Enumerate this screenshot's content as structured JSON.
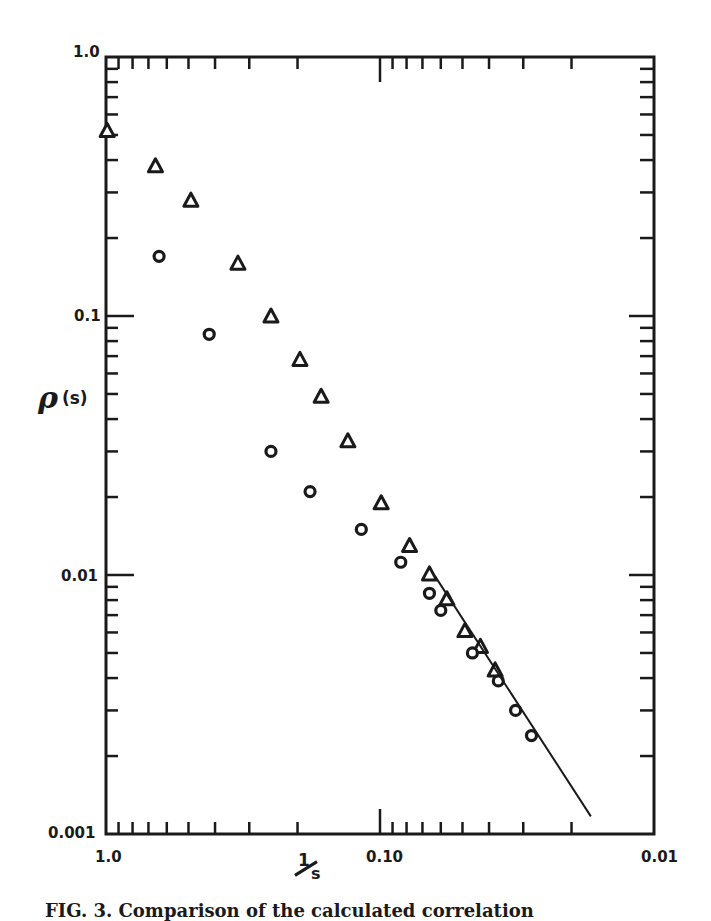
{
  "figure": {
    "caption": "FIG. 3.   Comparison of the calculated correlation"
  },
  "axes": {
    "ylabel_symbol": "ρ",
    "ylabel_arg": "(s)",
    "xlabel_numerator": "1",
    "xlabel_denominator": "s",
    "y_ticks": [
      {
        "value": 1.0,
        "label": "1.0"
      },
      {
        "value": 0.1,
        "label": "0.1"
      },
      {
        "value": 0.01,
        "label": "0.01"
      },
      {
        "value": 0.001,
        "label": "0.001"
      }
    ],
    "x_ticks": [
      {
        "value": 1.0,
        "label": "1.0"
      },
      {
        "value": 0.1,
        "label": "0.10"
      },
      {
        "value": 0.01,
        "label": "0.01"
      }
    ]
  },
  "chart_data": {
    "type": "scatter",
    "title": "",
    "xlabel": "1/s",
    "ylabel": "ρ(s)",
    "xscale": "log",
    "yscale": "log",
    "x_reversed": true,
    "xlim": [
      1.0,
      0.01
    ],
    "ylim": [
      0.001,
      1.0
    ],
    "grid": false,
    "legend": null,
    "x_tick_labels": [
      "1.0",
      "0.10",
      "0.01"
    ],
    "y_tick_labels": [
      "1.0",
      "0.1",
      "0.01",
      "0.001"
    ],
    "series": [
      {
        "name": "triangles",
        "marker": "triangle",
        "points": [
          {
            "x": 0.99,
            "y": 0.52
          },
          {
            "x": 0.66,
            "y": 0.38
          },
          {
            "x": 0.49,
            "y": 0.28
          },
          {
            "x": 0.33,
            "y": 0.16
          },
          {
            "x": 0.25,
            "y": 0.1
          },
          {
            "x": 0.196,
            "y": 0.068
          },
          {
            "x": 0.164,
            "y": 0.049
          },
          {
            "x": 0.131,
            "y": 0.033
          },
          {
            "x": 0.099,
            "y": 0.019
          },
          {
            "x": 0.078,
            "y": 0.013
          },
          {
            "x": 0.066,
            "y": 0.0101
          },
          {
            "x": 0.057,
            "y": 0.0081
          },
          {
            "x": 0.049,
            "y": 0.0061
          },
          {
            "x": 0.043,
            "y": 0.0053
          },
          {
            "x": 0.038,
            "y": 0.0043
          }
        ]
      },
      {
        "name": "circles",
        "marker": "circle",
        "points": [
          {
            "x": 0.64,
            "y": 0.17
          },
          {
            "x": 0.42,
            "y": 0.085
          },
          {
            "x": 0.25,
            "y": 0.03
          },
          {
            "x": 0.18,
            "y": 0.021
          },
          {
            "x": 0.117,
            "y": 0.015
          },
          {
            "x": 0.084,
            "y": 0.0112
          },
          {
            "x": 0.066,
            "y": 0.0085
          },
          {
            "x": 0.06,
            "y": 0.0073
          },
          {
            "x": 0.046,
            "y": 0.005
          },
          {
            "x": 0.037,
            "y": 0.0039
          },
          {
            "x": 0.032,
            "y": 0.003
          },
          {
            "x": 0.028,
            "y": 0.0024
          }
        ]
      },
      {
        "name": "fit line",
        "marker": "line",
        "points": [
          {
            "x": 0.063,
            "y": 0.0099
          },
          {
            "x": 0.017,
            "y": 0.00117
          }
        ]
      }
    ]
  },
  "style": {
    "ink": "#1a1a1a",
    "background": "#ffffff"
  }
}
